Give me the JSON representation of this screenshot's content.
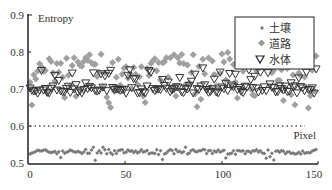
{
  "chart_data": {
    "type": "scatter",
    "title": "",
    "xlabel": "Pixel",
    "ylabel": "Entropy",
    "xlim": [
      0,
      150
    ],
    "ylim": [
      0.5,
      0.9
    ],
    "x_ticks": [
      "0",
      "50",
      "100",
      "150"
    ],
    "y_ticks": [
      "0.5",
      "0.6",
      "0.7",
      "0.8",
      "0.9"
    ],
    "grid": false,
    "legend_position": "upper right",
    "threshold_line": {
      "y": 0.6,
      "style": "dotted"
    },
    "series": [
      {
        "name": "土壤",
        "marker": "small-diamond",
        "color": "#888888",
        "approx_range": [
          0.51,
          0.55
        ],
        "mean": 0.53,
        "n": 150
      },
      {
        "name": "道路",
        "marker": "large-diamond",
        "color": "#9a9a9a",
        "approx_range": [
          0.65,
          0.8
        ],
        "mean": 0.74,
        "n": 150
      },
      {
        "name": "水体",
        "marker": "triangle-down-open",
        "color": "#333333",
        "approx_range": [
          0.68,
          0.76
        ],
        "mean": 0.7,
        "n": 150
      }
    ]
  },
  "axes": {
    "ylabel": "Entropy",
    "xlabel": "Pixel",
    "y_ticks": [
      "0.9",
      "0.8",
      "0.7",
      "0.6",
      "0.5"
    ],
    "x_ticks": [
      "0",
      "50",
      "100",
      "150"
    ]
  },
  "legend": {
    "items": [
      {
        "label": "土壤"
      },
      {
        "label": "道路"
      },
      {
        "label": "水体"
      }
    ]
  }
}
